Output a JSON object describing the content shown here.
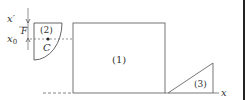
{
  "diagram": {
    "labels": {
      "x_prime": "x′",
      "force": "F",
      "x_zero": "x",
      "x_zero_sub": "0",
      "centroid": "C",
      "region1": "(1)",
      "region2": "(2)",
      "region3": "(3)",
      "x_axis": "x"
    },
    "colors": {
      "stroke": "#555555",
      "text": "#333333",
      "right_bar": "#222222"
    }
  }
}
